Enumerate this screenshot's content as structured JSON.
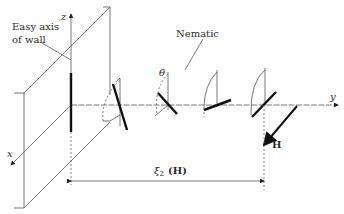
{
  "labels": {
    "wall_easy_axis_line1": "Easy axis",
    "wall_easy_axis_line2": "of wall",
    "nematic": "Nematic",
    "theta": "θ",
    "axis_x": "x",
    "axis_y": "y",
    "axis_z": "z",
    "field": "H",
    "length_xi": "ξ",
    "length_xi_sub": "2",
    "length_xi_arg": "(H)"
  },
  "colors": {
    "ink": "#111111",
    "thin_line": "#555555",
    "background": "#ffffff"
  }
}
